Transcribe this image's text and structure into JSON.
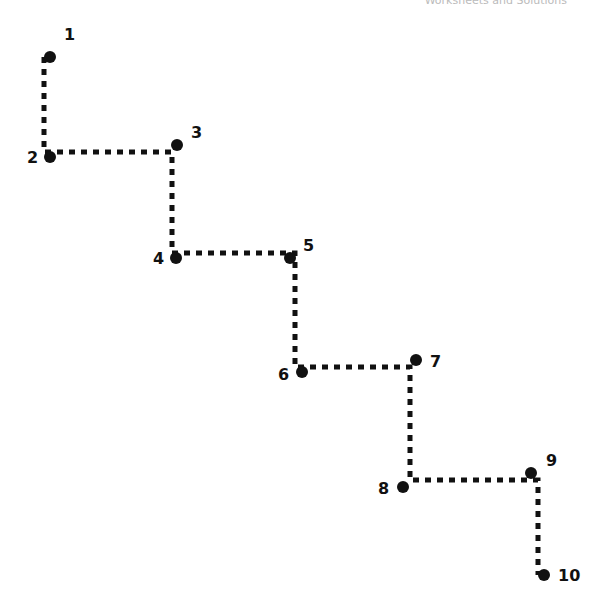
{
  "header": {
    "text": "Worksheets and Solutions"
  },
  "colors": {
    "line": "#111111",
    "dot": "#111111"
  },
  "points": [
    {
      "n": "1",
      "x": 50,
      "y": 57,
      "lx": 64,
      "ly": 40
    },
    {
      "n": "2",
      "x": 50,
      "y": 157,
      "lx": 27,
      "ly": 163
    },
    {
      "n": "3",
      "x": 177,
      "y": 145,
      "lx": 191,
      "ly": 138
    },
    {
      "n": "4",
      "x": 176,
      "y": 258,
      "lx": 153,
      "ly": 264
    },
    {
      "n": "5",
      "x": 290,
      "y": 258,
      "lx": 303,
      "ly": 251
    },
    {
      "n": "6",
      "x": 302,
      "y": 372,
      "lx": 278,
      "ly": 380
    },
    {
      "n": "7",
      "x": 416,
      "y": 360,
      "lx": 430,
      "ly": 367
    },
    {
      "n": "8",
      "x": 403,
      "y": 487,
      "lx": 378,
      "ly": 494
    },
    {
      "n": "9",
      "x": 531,
      "y": 473,
      "lx": 546,
      "ly": 466
    },
    {
      "n": "10",
      "x": 544,
      "y": 575,
      "lx": 558,
      "ly": 581
    }
  ],
  "path": [
    [
      44,
      57
    ],
    [
      44,
      152
    ],
    [
      172,
      152
    ],
    [
      172,
      253
    ],
    [
      295,
      253
    ],
    [
      295,
      367
    ],
    [
      410,
      367
    ],
    [
      410,
      480
    ],
    [
      538,
      480
    ],
    [
      538,
      575
    ]
  ]
}
